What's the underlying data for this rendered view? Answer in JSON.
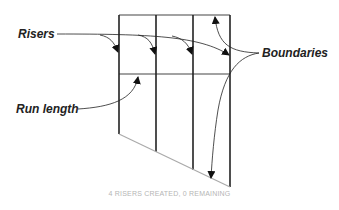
{
  "labels": {
    "risers": "Risers",
    "boundaries": "Boundaries",
    "run_length": "Run length"
  },
  "status": "4 RISERS CREATED, 0 REMAINING",
  "colors": {
    "line": "#333333",
    "slant": "#aaaaaa",
    "status_text": "#b5b5b5"
  }
}
